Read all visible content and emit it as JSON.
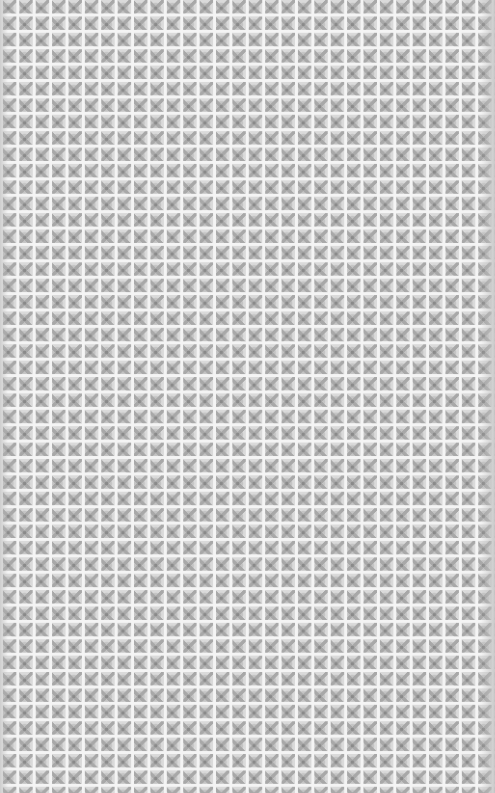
{
  "pattern": {
    "description": "repeating gray tiled ornamental pattern with white grid lines",
    "cell_size_px": 16.4,
    "colors": {
      "grid_line": "#f4f4f4",
      "tile_base": "#d4d4d4",
      "motif": "#a8a8a8",
      "center_dot": "#8a8a8a"
    }
  }
}
